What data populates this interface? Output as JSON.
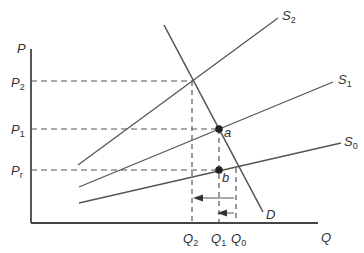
{
  "diagram": {
    "axes": {
      "y_label": "P",
      "x_label": "Q"
    },
    "price_labels": [
      {
        "main": "P",
        "sub": "2"
      },
      {
        "main": "P",
        "sub": "1"
      },
      {
        "main": "P",
        "sub": "r"
      }
    ],
    "quantity_labels": [
      {
        "main": "Q",
        "sub": "2"
      },
      {
        "main": "Q",
        "sub": "1"
      },
      {
        "main": "Q",
        "sub": "0"
      }
    ],
    "curves": {
      "demand": "D",
      "supply": [
        {
          "main": "S",
          "sub": "2"
        },
        {
          "main": "S",
          "sub": "1"
        },
        {
          "main": "S",
          "sub": "0"
        }
      ]
    },
    "points": {
      "a": "a",
      "b": "b"
    },
    "colors": {
      "line": "#555555",
      "dash": "#555555",
      "point": "#222222"
    }
  }
}
